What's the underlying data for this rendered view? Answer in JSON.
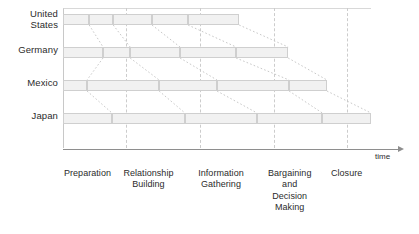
{
  "figure": {
    "axis_caption": "time",
    "bar_fill_color": "#f1f1f1",
    "bar_border_color": "#cfcfcf",
    "guideline_color": "#cccccc",
    "axis_color": "#8e8e8e"
  },
  "chart_data": {
    "type": "bar",
    "title": "",
    "subtitle": "",
    "xlabel": "time",
    "ylabel": "",
    "grid": false,
    "legend": "none",
    "orientation": "horizontal-stacked",
    "categories": [
      "United States",
      "Germany",
      "Mexico",
      "Japan"
    ],
    "phases": [
      "Preparation",
      "Relationship Building",
      "Information Gathering",
      "Bargaining and Decision Making",
      "Closure"
    ],
    "phase_labels_lines": [
      [
        "Preparation"
      ],
      [
        "Relationship",
        "Building"
      ],
      [
        "Information",
        "Gathering"
      ],
      [
        "Bargaining",
        "and",
        "Decision",
        "Making"
      ],
      [
        "Closure"
      ]
    ],
    "note": "Relative duration of each negotiation phase per culture, as a fraction of total timeline width (0-1).",
    "series": [
      {
        "name": "United States",
        "segments": [
          {
            "phase": "Preparation",
            "start": 0.0,
            "end": 0.085
          },
          {
            "phase": "Relationship Building",
            "start": 0.085,
            "end": 0.163
          },
          {
            "phase": "Information Gathering",
            "start": 0.163,
            "end": 0.289
          },
          {
            "phase": "Bargaining and Decision Making",
            "start": 0.289,
            "end": 0.406
          },
          {
            "phase": "Closure",
            "start": 0.406,
            "end": 0.572
          }
        ],
        "total": 0.572
      },
      {
        "name": "Germany",
        "segments": [
          {
            "phase": "Preparation",
            "start": 0.0,
            "end": 0.13
          },
          {
            "phase": "Relationship Building",
            "start": 0.13,
            "end": 0.218
          },
          {
            "phase": "Information Gathering",
            "start": 0.218,
            "end": 0.38
          },
          {
            "phase": "Bargaining and Decision Making",
            "start": 0.38,
            "end": 0.562
          },
          {
            "phase": "Closure",
            "start": 0.562,
            "end": 0.731
          }
        ],
        "total": 0.731
      },
      {
        "name": "Mexico",
        "segments": [
          {
            "phase": "Preparation",
            "start": 0.0,
            "end": 0.078
          },
          {
            "phase": "Relationship Building",
            "start": 0.078,
            "end": 0.312
          },
          {
            "phase": "Information Gathering",
            "start": 0.312,
            "end": 0.5
          },
          {
            "phase": "Bargaining and Decision Making",
            "start": 0.5,
            "end": 0.734
          },
          {
            "phase": "Closure",
            "start": 0.734,
            "end": 0.857
          }
        ],
        "total": 0.857
      },
      {
        "name": "Japan",
        "segments": [
          {
            "phase": "Preparation",
            "start": 0.0,
            "end": 0.159
          },
          {
            "phase": "Relationship Building",
            "start": 0.159,
            "end": 0.396
          },
          {
            "phase": "Information Gathering",
            "start": 0.396,
            "end": 0.63
          },
          {
            "phase": "Bargaining and Decision Making",
            "start": 0.63,
            "end": 0.842
          },
          {
            "phase": "Closure",
            "start": 0.842,
            "end": 1.0
          }
        ],
        "total": 1.0
      }
    ],
    "guideline_positions": [
      0.205,
      0.445,
      0.685,
      0.922
    ]
  }
}
